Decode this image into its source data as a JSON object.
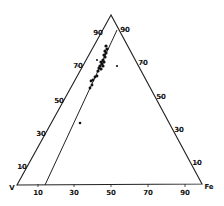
{
  "diagram": {
    "type": "ternary",
    "vertices": {
      "top": {
        "label": "",
        "x": 111,
        "y": 15,
        "note": "apex label present but illegible at this resolution"
      },
      "bottom_left": {
        "label": "V",
        "x": 17,
        "y": 185
      },
      "bottom_right": {
        "label": "Fe",
        "x": 202,
        "y": 184
      }
    },
    "label_positions": {
      "top": {
        "x": 112,
        "y": 9
      },
      "bottom_left": {
        "x": 12,
        "y": 188
      },
      "bottom_right": {
        "x": 209,
        "y": 187
      }
    },
    "inner_line": {
      "x1": 117,
      "y1": 30,
      "x2": 45,
      "y2": 185
    },
    "tick_labels_note": "Tick label text is illegible at source resolution. Values below are inferred from five evenly spaced marks per side (10/30/50/70/90 on a 0-100 axis); they are an assumption, not a reading.",
    "bottom_ticks": [
      {
        "label": "10",
        "x": 38,
        "y": 193
      },
      {
        "label": "30",
        "x": 74,
        "y": 193
      },
      {
        "label": "50",
        "x": 111,
        "y": 193
      },
      {
        "label": "70",
        "x": 148,
        "y": 193
      },
      {
        "label": "90",
        "x": 185,
        "y": 193
      }
    ],
    "left_ticks": [
      {
        "label": "90",
        "x": 98,
        "y": 33
      },
      {
        "label": "70",
        "x": 78,
        "y": 66
      },
      {
        "label": "50",
        "x": 59,
        "y": 101
      },
      {
        "label": "30",
        "x": 41,
        "y": 134
      },
      {
        "label": "10",
        "x": 22,
        "y": 167
      }
    ],
    "right_ticks": [
      {
        "label": "90",
        "x": 125,
        "y": 30
      },
      {
        "label": "70",
        "x": 143,
        "y": 63
      },
      {
        "label": "50",
        "x": 161,
        "y": 97
      },
      {
        "label": "30",
        "x": 179,
        "y": 130
      },
      {
        "label": "10",
        "x": 197,
        "y": 163
      }
    ],
    "points": [
      {
        "x": 106,
        "y": 46,
        "r": 1.6
      },
      {
        "x": 107,
        "y": 49,
        "r": 1.6
      },
      {
        "x": 105,
        "y": 51,
        "r": 1.6
      },
      {
        "x": 106,
        "y": 53,
        "r": 1.6
      },
      {
        "x": 104,
        "y": 55,
        "r": 1.6
      },
      {
        "x": 105,
        "y": 57,
        "r": 1.6
      },
      {
        "x": 103,
        "y": 60,
        "r": 1.6
      },
      {
        "x": 101,
        "y": 62,
        "r": 1.6
      },
      {
        "x": 104,
        "y": 62,
        "r": 1.6
      },
      {
        "x": 102,
        "y": 64,
        "r": 1.6
      },
      {
        "x": 100,
        "y": 66,
        "r": 1.6
      },
      {
        "x": 103,
        "y": 66,
        "r": 1.6
      },
      {
        "x": 99,
        "y": 68,
        "r": 1.6
      },
      {
        "x": 101,
        "y": 69,
        "r": 1.6
      },
      {
        "x": 98,
        "y": 71,
        "r": 1.6
      },
      {
        "x": 97,
        "y": 76,
        "r": 1.4
      },
      {
        "x": 95,
        "y": 77,
        "r": 1.4
      },
      {
        "x": 93,
        "y": 80,
        "r": 1.4
      },
      {
        "x": 91,
        "y": 81,
        "r": 1.4
      },
      {
        "x": 92,
        "y": 85,
        "r": 1.4
      },
      {
        "x": 90,
        "y": 88,
        "r": 1.4
      },
      {
        "x": 97,
        "y": 60,
        "r": 1.0
      },
      {
        "x": 117,
        "y": 66,
        "r": 1.1
      },
      {
        "x": 80,
        "y": 123,
        "r": 1.3
      }
    ]
  }
}
